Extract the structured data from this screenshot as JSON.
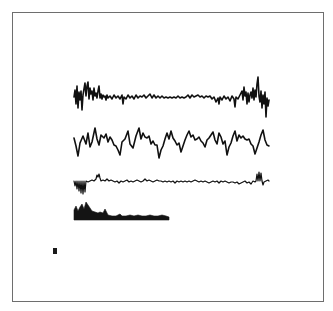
{
  "figure": {
    "frame": {
      "x": 12,
      "y": 12,
      "width": 312,
      "height": 290,
      "border_color": "#6e6e6e"
    },
    "ink_color": "#111111",
    "marker": {
      "x": 53,
      "y": 248,
      "width": 4,
      "height": 6,
      "color": "#1a1a1a"
    }
  },
  "chart_data": [
    {
      "type": "line",
      "name": "trace-1-noisy-signal",
      "title": "",
      "xlabel": "",
      "ylabel": "",
      "x_range": [
        74,
        269
      ],
      "baseline_y": 97,
      "stroke_width": 1.6,
      "points": [
        [
          74,
          97
        ],
        [
          75,
          90
        ],
        [
          76,
          104
        ],
        [
          77,
          86
        ],
        [
          78,
          108
        ],
        [
          79,
          92
        ],
        [
          80,
          100
        ],
        [
          81,
          91
        ],
        [
          82,
          110
        ],
        [
          83,
          95
        ],
        [
          84,
          89
        ],
        [
          85,
          83
        ],
        [
          86,
          96
        ],
        [
          87,
          86
        ],
        [
          88,
          82
        ],
        [
          89,
          99
        ],
        [
          90,
          88
        ],
        [
          91,
          94
        ],
        [
          92,
          91
        ],
        [
          93,
          100
        ],
        [
          94,
          88
        ],
        [
          95,
          96
        ],
        [
          96,
          93
        ],
        [
          97,
          98
        ],
        [
          98,
          91
        ],
        [
          99,
          86
        ],
        [
          100,
          98
        ],
        [
          101,
          94
        ],
        [
          102,
          99
        ],
        [
          103,
          95
        ],
        [
          104,
          97
        ],
        [
          105,
          96
        ],
        [
          106,
          100
        ],
        [
          107,
          95
        ],
        [
          108,
          98
        ],
        [
          110,
          96
        ],
        [
          112,
          99
        ],
        [
          114,
          95
        ],
        [
          116,
          98
        ],
        [
          118,
          96
        ],
        [
          120,
          99
        ],
        [
          122,
          95
        ],
        [
          123,
          104
        ],
        [
          124,
          97
        ],
        [
          126,
          99
        ],
        [
          128,
          95
        ],
        [
          130,
          98
        ],
        [
          132,
          96
        ],
        [
          134,
          99
        ],
        [
          136,
          95
        ],
        [
          138,
          98
        ],
        [
          140,
          96
        ],
        [
          142,
          97
        ],
        [
          144,
          95
        ],
        [
          146,
          98
        ],
        [
          148,
          96
        ],
        [
          150,
          94
        ],
        [
          152,
          98
        ],
        [
          154,
          95
        ],
        [
          156,
          98
        ],
        [
          158,
          96
        ],
        [
          160,
          98
        ],
        [
          162,
          96
        ],
        [
          164,
          98
        ],
        [
          166,
          97
        ],
        [
          168,
          98
        ],
        [
          170,
          97
        ],
        [
          172,
          98
        ],
        [
          174,
          97
        ],
        [
          176,
          98
        ],
        [
          178,
          96
        ],
        [
          180,
          98
        ],
        [
          182,
          97
        ],
        [
          184,
          98
        ],
        [
          186,
          97
        ],
        [
          188,
          95
        ],
        [
          190,
          98
        ],
        [
          192,
          95
        ],
        [
          194,
          97
        ],
        [
          196,
          96
        ],
        [
          198,
          95
        ],
        [
          200,
          97
        ],
        [
          202,
          96
        ],
        [
          204,
          98
        ],
        [
          206,
          96
        ],
        [
          208,
          97
        ],
        [
          210,
          96
        ],
        [
          212,
          99
        ],
        [
          214,
          97
        ],
        [
          216,
          102
        ],
        [
          218,
          98
        ],
        [
          219,
          104
        ],
        [
          220,
          97
        ],
        [
          222,
          100
        ],
        [
          224,
          96
        ],
        [
          226,
          99
        ],
        [
          228,
          97
        ],
        [
          230,
          101
        ],
        [
          232,
          96
        ],
        [
          234,
          99
        ],
        [
          235,
          107
        ],
        [
          236,
          97
        ],
        [
          238,
          99
        ],
        [
          240,
          95
        ],
        [
          242,
          91
        ],
        [
          243,
          100
        ],
        [
          244,
          87
        ],
        [
          245,
          96
        ],
        [
          246,
          92
        ],
        [
          247,
          104
        ],
        [
          248,
          93
        ],
        [
          249,
          102
        ],
        [
          250,
          95
        ],
        [
          251,
          92
        ],
        [
          252,
          98
        ],
        [
          253,
          88
        ],
        [
          254,
          100
        ],
        [
          255,
          90
        ],
        [
          256,
          97
        ],
        [
          257,
          84
        ],
        [
          258,
          77
        ],
        [
          259,
          96
        ],
        [
          260,
          102
        ],
        [
          261,
          91
        ],
        [
          262,
          108
        ],
        [
          263,
          95
        ],
        [
          264,
          104
        ],
        [
          265,
          92
        ],
        [
          266,
          117
        ],
        [
          267,
          98
        ],
        [
          268,
          106
        ],
        [
          269,
          100
        ]
      ]
    },
    {
      "type": "line",
      "name": "trace-2-periodic-signal",
      "title": "",
      "xlabel": "",
      "ylabel": "",
      "x_range": [
        74,
        269
      ],
      "baseline_y": 142,
      "stroke_width": 1.6,
      "points": [
        [
          74,
          138
        ],
        [
          76,
          146
        ],
        [
          78,
          156
        ],
        [
          80,
          143
        ],
        [
          83,
          136
        ],
        [
          86,
          144
        ],
        [
          88,
          133
        ],
        [
          90,
          147
        ],
        [
          92,
          142
        ],
        [
          95,
          128
        ],
        [
          97,
          139
        ],
        [
          99,
          145
        ],
        [
          101,
          135
        ],
        [
          104,
          138
        ],
        [
          106,
          134
        ],
        [
          108,
          142
        ],
        [
          110,
          137
        ],
        [
          112,
          140
        ],
        [
          114,
          145
        ],
        [
          116,
          146
        ],
        [
          118,
          150
        ],
        [
          120,
          155
        ],
        [
          122,
          142
        ],
        [
          125,
          139
        ],
        [
          128,
          131
        ],
        [
          130,
          144
        ],
        [
          133,
          148
        ],
        [
          136,
          136
        ],
        [
          139,
          128
        ],
        [
          141,
          139
        ],
        [
          143,
          133
        ],
        [
          145,
          137
        ],
        [
          147,
          138
        ],
        [
          149,
          136
        ],
        [
          151,
          144
        ],
        [
          153,
          141
        ],
        [
          155,
          145
        ],
        [
          157,
          145
        ],
        [
          159,
          158
        ],
        [
          161,
          150
        ],
        [
          163,
          146
        ],
        [
          165,
          139
        ],
        [
          167,
          133
        ],
        [
          169,
          139
        ],
        [
          171,
          131
        ],
        [
          173,
          138
        ],
        [
          175,
          141
        ],
        [
          177,
          145
        ],
        [
          179,
          143
        ],
        [
          181,
          152
        ],
        [
          183,
          146
        ],
        [
          185,
          140
        ],
        [
          187,
          135
        ],
        [
          189,
          131
        ],
        [
          191,
          137
        ],
        [
          193,
          135
        ],
        [
          195,
          140
        ],
        [
          197,
          139
        ],
        [
          199,
          137
        ],
        [
          201,
          141
        ],
        [
          203,
          143
        ],
        [
          205,
          147
        ],
        [
          207,
          140
        ],
        [
          209,
          138
        ],
        [
          211,
          135
        ],
        [
          213,
          132
        ],
        [
          215,
          140
        ],
        [
          217,
          144
        ],
        [
          219,
          133
        ],
        [
          221,
          137
        ],
        [
          223,
          144
        ],
        [
          225,
          141
        ],
        [
          227,
          155
        ],
        [
          229,
          147
        ],
        [
          231,
          143
        ],
        [
          233,
          136
        ],
        [
          235,
          131
        ],
        [
          237,
          141
        ],
        [
          239,
          135
        ],
        [
          241,
          138
        ],
        [
          243,
          136
        ],
        [
          245,
          139
        ],
        [
          247,
          140
        ],
        [
          249,
          139
        ],
        [
          251,
          144
        ],
        [
          253,
          146
        ],
        [
          255,
          154
        ],
        [
          257,
          148
        ],
        [
          259,
          142
        ],
        [
          261,
          135
        ],
        [
          263,
          130
        ],
        [
          265,
          140
        ],
        [
          267,
          145
        ],
        [
          269,
          146
        ]
      ]
    },
    {
      "type": "line",
      "name": "trace-3-event-signal",
      "title": "",
      "xlabel": "",
      "ylabel": "",
      "x_range": [
        74,
        269
      ],
      "baseline_y": 181,
      "stroke_width": 1.2,
      "points": [
        [
          74,
          181
        ],
        [
          75,
          186
        ],
        [
          76,
          181
        ],
        [
          77,
          189
        ],
        [
          78,
          181
        ],
        [
          79,
          191
        ],
        [
          80,
          181
        ],
        [
          81,
          193
        ],
        [
          82,
          181
        ],
        [
          83,
          194
        ],
        [
          84,
          181
        ],
        [
          85,
          192
        ],
        [
          86,
          181
        ],
        [
          88,
          182
        ],
        [
          90,
          181
        ],
        [
          92,
          180
        ],
        [
          94,
          181
        ],
        [
          96,
          179
        ],
        [
          97,
          175
        ],
        [
          98,
          177
        ],
        [
          99,
          174
        ],
        [
          100,
          178
        ],
        [
          101,
          181
        ],
        [
          103,
          180
        ],
        [
          105,
          181
        ],
        [
          107,
          179
        ],
        [
          109,
          181
        ],
        [
          111,
          180
        ],
        [
          113,
          181
        ],
        [
          115,
          182
        ],
        [
          117,
          181
        ],
        [
          119,
          183
        ],
        [
          121,
          181
        ],
        [
          123,
          182
        ],
        [
          125,
          181
        ],
        [
          127,
          180
        ],
        [
          129,
          182
        ],
        [
          131,
          181
        ],
        [
          133,
          182
        ],
        [
          135,
          181
        ],
        [
          137,
          180
        ],
        [
          139,
          181
        ],
        [
          141,
          182
        ],
        [
          143,
          181
        ],
        [
          145,
          179
        ],
        [
          147,
          181
        ],
        [
          149,
          180
        ],
        [
          151,
          181
        ],
        [
          153,
          182
        ],
        [
          155,
          181
        ],
        [
          157,
          180
        ],
        [
          159,
          181
        ],
        [
          161,
          181
        ],
        [
          163,
          182
        ],
        [
          165,
          181
        ],
        [
          167,
          182
        ],
        [
          169,
          181
        ],
        [
          171,
          182
        ],
        [
          173,
          181
        ],
        [
          175,
          183
        ],
        [
          177,
          181
        ],
        [
          179,
          182
        ],
        [
          181,
          181
        ],
        [
          183,
          182
        ],
        [
          185,
          181
        ],
        [
          187,
          182
        ],
        [
          189,
          181
        ],
        [
          191,
          182
        ],
        [
          193,
          181
        ],
        [
          195,
          180
        ],
        [
          197,
          181
        ],
        [
          199,
          182
        ],
        [
          201,
          181
        ],
        [
          203,
          182
        ],
        [
          205,
          181
        ],
        [
          207,
          182
        ],
        [
          209,
          183
        ],
        [
          211,
          182
        ],
        [
          213,
          181
        ],
        [
          215,
          182
        ],
        [
          217,
          181
        ],
        [
          219,
          183
        ],
        [
          221,
          181
        ],
        [
          223,
          182
        ],
        [
          225,
          181
        ],
        [
          227,
          182
        ],
        [
          229,
          183
        ],
        [
          231,
          182
        ],
        [
          233,
          182
        ],
        [
          235,
          183
        ],
        [
          237,
          182
        ],
        [
          239,
          184
        ],
        [
          241,
          183
        ],
        [
          243,
          182
        ],
        [
          245,
          181
        ],
        [
          247,
          183
        ],
        [
          249,
          182
        ],
        [
          251,
          184
        ],
        [
          253,
          181
        ],
        [
          255,
          182
        ],
        [
          256,
          181
        ],
        [
          257,
          174
        ],
        [
          258,
          181
        ],
        [
          259,
          172
        ],
        [
          260,
          181
        ],
        [
          261,
          173
        ],
        [
          262,
          181
        ],
        [
          263,
          185
        ],
        [
          264,
          182
        ],
        [
          266,
          181
        ],
        [
          268,
          180
        ],
        [
          269,
          181
        ]
      ]
    },
    {
      "type": "area",
      "name": "trace-4-histogram",
      "title": "",
      "xlabel": "",
      "ylabel": "",
      "x_range": [
        74,
        169
      ],
      "baseline_y": 220,
      "points": [
        [
          74,
          220
        ],
        [
          74,
          210
        ],
        [
          76,
          206
        ],
        [
          78,
          211
        ],
        [
          80,
          207
        ],
        [
          82,
          204
        ],
        [
          84,
          209
        ],
        [
          86,
          202
        ],
        [
          88,
          205
        ],
        [
          90,
          208
        ],
        [
          92,
          211
        ],
        [
          95,
          212
        ],
        [
          98,
          213
        ],
        [
          100,
          212
        ],
        [
          103,
          213
        ],
        [
          105,
          209
        ],
        [
          107,
          213
        ],
        [
          108,
          215
        ],
        [
          112,
          216
        ],
        [
          116,
          216
        ],
        [
          120,
          214
        ],
        [
          122,
          216
        ],
        [
          126,
          216
        ],
        [
          130,
          215
        ],
        [
          134,
          216
        ],
        [
          138,
          215
        ],
        [
          142,
          216
        ],
        [
          146,
          216
        ],
        [
          150,
          215
        ],
        [
          154,
          216
        ],
        [
          158,
          216
        ],
        [
          162,
          215
        ],
        [
          166,
          216
        ],
        [
          169,
          217
        ],
        [
          169,
          220
        ]
      ]
    }
  ]
}
